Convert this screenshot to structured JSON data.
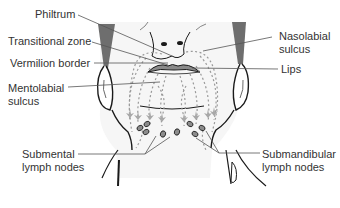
{
  "diagram": {
    "labels": {
      "philtrum": "Philtrum",
      "transitional_zone": "Transitional zone",
      "vermilion_border": "Vermilion border",
      "mentolabial_sulcus_1": "Mentolabial",
      "mentolabial_sulcus_2": "sulcus",
      "nasolabial_sulcus_1": "Nasolabial",
      "nasolabial_sulcus_2": "sulcus",
      "lips": "Lips",
      "submental_1": "Submental",
      "submental_2": "lymph nodes",
      "submandibular_1": "Submandibular",
      "submandibular_2": "lymph nodes"
    },
    "colors": {
      "outline": "#1a1a1a",
      "leader_line": "#555555",
      "face_fill": "#f4f4f4",
      "face_shadow": "#6e6e6e",
      "lip_fill": "#8a8a8a",
      "dotted_path": "#9a9a9a",
      "arrow": "#a8a8a8",
      "node_fill": "#8c8c8c"
    }
  }
}
